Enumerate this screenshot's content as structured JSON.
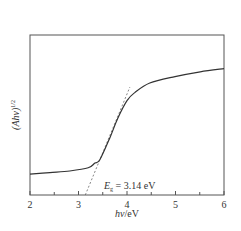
{
  "chart_data": {
    "type": "line",
    "title": "",
    "xlabel": "hν/eV",
    "xlabel_parts": {
      "italic": "hν",
      "plain": "/eV"
    },
    "ylabel": "(Ahν)^1/2",
    "ylabel_parts": {
      "main": "(Ahν)",
      "sup": "1/2"
    },
    "xlim": [
      2,
      6
    ],
    "ylim": [
      0,
      1
    ],
    "x_ticks": [
      2,
      3,
      4,
      5,
      6
    ],
    "x_tick_labels": [
      "2",
      "3",
      "4",
      "5",
      "6"
    ],
    "x_minor_ticks": [
      2.5,
      3.5,
      4.5,
      5.5
    ],
    "y_ticks": [],
    "grid": false,
    "legend": null,
    "series": [
      {
        "name": "(Ahν)^1/2",
        "style": "solid",
        "color": "#333333",
        "x": [
          2.0,
          2.41,
          2.82,
          3.2,
          3.34,
          3.44,
          3.65,
          3.81,
          4.0,
          4.16,
          4.47,
          4.99,
          5.51,
          6.0
        ],
        "y": [
          0.13,
          0.14,
          0.15,
          0.17,
          0.2,
          0.22,
          0.36,
          0.48,
          0.59,
          0.64,
          0.7,
          0.74,
          0.77,
          0.79
        ]
      },
      {
        "name": "Tangent (extrapolation)",
        "style": "dashed",
        "color": "#555555",
        "x": [
          3.14,
          4.06
        ],
        "y": [
          0.0,
          0.675
        ]
      }
    ],
    "annotations": [
      {
        "text": "E_g = 3.14 eV",
        "parts": {
          "E": "E",
          "sub": "g",
          "rest": " = 3.14 eV"
        },
        "x": 3.55,
        "y": 0.1
      }
    ]
  },
  "plot": {
    "frame_color": "#555555",
    "line_color": "#333333"
  }
}
